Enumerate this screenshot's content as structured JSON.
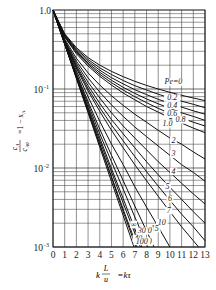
{
  "chart_data": {
    "type": "line",
    "title": "",
    "xlabel": "k L/u = kτ",
    "ylabel": "cA/cA0 = 1 - xA",
    "xscale": "linear",
    "yscale": "log",
    "xlim": [
      0,
      13
    ],
    "ylim": [
      0.001,
      1.0
    ],
    "grid": true,
    "legend": "inline curve labels",
    "x_ticks": [
      "0",
      "1",
      "2",
      "3",
      "4",
      "5",
      "6",
      "7",
      "8",
      "9",
      "10",
      "11",
      "12",
      "13"
    ],
    "y_ticks": [
      "1.0",
      "10^-1",
      "10^-2",
      "10^-3"
    ],
    "x": [
      0,
      1,
      2,
      3,
      4,
      5,
      6,
      7,
      8,
      9,
      10,
      11,
      12,
      13
    ],
    "series": [
      {
        "name": "Pe=0",
        "label": "Pe=0",
        "values": [
          1,
          0.5,
          0.333,
          0.25,
          0.2,
          0.167,
          0.143,
          0.125,
          0.111,
          0.1,
          0.0909,
          0.0833,
          0.0769,
          0.0714
        ]
      },
      {
        "name": "Pe=0.2",
        "label": "0.2",
        "values": [
          1,
          0.49,
          0.32,
          0.236,
          0.185,
          0.152,
          0.128,
          0.11,
          0.097,
          0.086,
          0.077,
          0.07,
          0.064,
          0.058
        ]
      },
      {
        "name": "Pe=0.4",
        "label": "0.4",
        "values": [
          1,
          0.48,
          0.31,
          0.224,
          0.173,
          0.139,
          0.116,
          0.098,
          0.085,
          0.074,
          0.066,
          0.059,
          0.053,
          0.048
        ]
      },
      {
        "name": "Pe=0.6",
        "label": "0.6",
        "values": [
          1,
          0.47,
          0.3,
          0.213,
          0.162,
          0.129,
          0.105,
          0.088,
          0.075,
          0.065,
          0.057,
          0.05,
          0.045,
          0.04
        ]
      },
      {
        "name": "Pe=0.8",
        "label": "0.8",
        "values": [
          1,
          0.46,
          0.29,
          0.204,
          0.153,
          0.12,
          0.097,
          0.08,
          0.067,
          0.057,
          0.049,
          0.043,
          0.038,
          0.034
        ]
      },
      {
        "name": "Pe=1.0",
        "label": "1.0",
        "values": [
          1,
          0.455,
          0.28,
          0.195,
          0.145,
          0.112,
          0.089,
          0.073,
          0.06,
          0.051,
          0.043,
          0.037,
          0.032,
          0.028
        ]
      },
      {
        "name": "Pe=2",
        "label": "2",
        "values": [
          1,
          0.43,
          0.245,
          0.16,
          0.112,
          0.082,
          0.062,
          0.048,
          0.038,
          0.03,
          0.024,
          0.02,
          0.016,
          0.013
        ]
      },
      {
        "name": "Pe=3",
        "label": "3",
        "values": [
          1,
          0.415,
          0.225,
          0.138,
          0.091,
          0.063,
          0.045,
          0.033,
          0.025,
          0.019,
          0.0145,
          0.011,
          0.0088,
          0.0068
        ]
      },
      {
        "name": "Pe=4",
        "label": "4",
        "values": [
          1,
          0.405,
          0.21,
          0.122,
          0.077,
          0.05,
          0.034,
          0.024,
          0.017,
          0.012,
          0.0088,
          0.0064,
          0.0047,
          0.0035
        ]
      },
      {
        "name": "Pe=5",
        "label": "5",
        "values": [
          1,
          0.4,
          0.198,
          0.11,
          0.066,
          0.041,
          0.027,
          0.018,
          0.012,
          0.0082,
          0.0057,
          0.004,
          0.0028,
          0.002
        ]
      },
      {
        "name": "Pe=6",
        "label": "6",
        "values": [
          1,
          0.395,
          0.19,
          0.101,
          0.058,
          0.035,
          0.022,
          0.014,
          0.009,
          0.0059,
          0.0039,
          0.0026,
          0.0018,
          0.0012
        ]
      },
      {
        "name": "Pe=7",
        "label": "7",
        "values": [
          1,
          0.39,
          0.183,
          0.094,
          0.052,
          0.03,
          0.018,
          0.011,
          0.0069,
          0.0044,
          0.0028,
          0.0018,
          0.0012,
          null
        ]
      },
      {
        "name": "Pe=10",
        "label": "10",
        "values": [
          1,
          0.385,
          0.17,
          0.08,
          0.039,
          0.02,
          0.011,
          0.0058,
          0.0032,
          0.0018,
          0.001,
          null,
          null,
          null
        ]
      },
      {
        "name": "Pe=15",
        "label": "15",
        "values": [
          1,
          0.38,
          0.158,
          0.069,
          0.031,
          0.0145,
          0.0069,
          0.0033,
          0.0016,
          null,
          null,
          null,
          null,
          null
        ]
      },
      {
        "name": "Pe=20",
        "label": "20",
        "values": [
          1,
          0.377,
          0.152,
          0.064,
          0.027,
          0.012,
          0.0054,
          0.0024,
          0.0011,
          null,
          null,
          null,
          null,
          null
        ]
      },
      {
        "name": "Pe=30",
        "label": "30",
        "values": [
          1,
          0.374,
          0.146,
          0.059,
          0.024,
          0.0098,
          0.0041,
          0.0017,
          null,
          null,
          null,
          null,
          null,
          null
        ]
      },
      {
        "name": "Pe=40",
        "label": "40",
        "values": [
          1,
          0.372,
          0.143,
          0.056,
          0.022,
          0.0089,
          0.0036,
          0.0015,
          null,
          null,
          null,
          null,
          null,
          null
        ]
      },
      {
        "name": "Pe=70",
        "label": "70",
        "values": [
          1,
          0.37,
          0.14,
          0.053,
          0.02,
          0.0078,
          0.003,
          0.0012,
          null,
          null,
          null,
          null,
          null,
          null
        ]
      },
      {
        "name": "Pe=100",
        "label": "100",
        "values": [
          1,
          0.369,
          0.138,
          0.052,
          0.0198,
          0.0075,
          0.0028,
          0.0011,
          null,
          null,
          null,
          null,
          null,
          null
        ]
      },
      {
        "name": "Pe=∞",
        "label": "∞",
        "values": [
          1,
          0.368,
          0.135,
          0.0498,
          0.0183,
          0.0067,
          0.0025,
          null,
          null,
          null,
          null,
          null,
          null,
          null
        ]
      }
    ],
    "annotations": [
      {
        "text": "Pe=0",
        "x": 10.3,
        "y": 0.115
      },
      {
        "text": "0.2",
        "x": 10.2,
        "y": 0.072
      },
      {
        "text": "0.4",
        "x": 10.2,
        "y": 0.058
      },
      {
        "text": "0.6",
        "x": 10.2,
        "y": 0.045
      },
      {
        "text": "0.8",
        "x": 10.9,
        "y": 0.038
      },
      {
        "text": "1.0",
        "x": 9.8,
        "y": 0.034
      },
      {
        "text": "2",
        "x": 10.3,
        "y": 0.021
      },
      {
        "text": "3",
        "x": 10.3,
        "y": 0.014
      },
      {
        "text": "4",
        "x": 10.3,
        "y": 0.0085
      },
      {
        "text": "5",
        "x": 9.8,
        "y": 0.0055
      },
      {
        "text": "6",
        "x": 10.0,
        "y": 0.0038
      },
      {
        "text": "7",
        "x": 9.9,
        "y": 0.0027
      },
      {
        "text": "10",
        "x": 9.3,
        "y": 0.0019
      },
      {
        "text": "15",
        "x": 8.7,
        "y": 0.0016
      },
      {
        "text": "20",
        "x": 8.1,
        "y": 0.0015
      },
      {
        "text": "30",
        "x": 7.6,
        "y": 0.0015
      },
      {
        "text": "40",
        "x": 7.3,
        "y": 0.0012
      },
      {
        "text": "70",
        "x": 8.1,
        "y": 0.0011
      },
      {
        "text": "100",
        "x": 7.6,
        "y": 0.0011
      },
      {
        "text": "∞",
        "x": 6.9,
        "y": 0.0018
      }
    ]
  },
  "axis": {
    "y_label_top": "c",
    "y_label_text": "cA/cA0 = 1 − xA",
    "x_label_text": "k L/u = kτ"
  }
}
